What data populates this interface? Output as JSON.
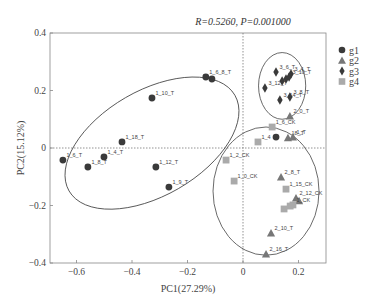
{
  "chart_data": {
    "type": "scatter",
    "title": "R=0.5260, P=0.001000",
    "xlabel": "PC1(27.29%)",
    "ylabel": "PC2(15.12%)",
    "xlim": [
      -0.69,
      0.3
    ],
    "ylim": [
      -0.4,
      0.4
    ],
    "xticks": [
      -0.6,
      -0.4,
      -0.2,
      0,
      0.2
    ],
    "xtick_labels": [
      "-0.6",
      "-0.4",
      "-0.2",
      "0",
      "0.2"
    ],
    "yticks": [
      0.4,
      0.2,
      0,
      -0.2,
      -0.4
    ],
    "ytick_labels": [
      "0.4",
      "0.2",
      "0",
      "-0.2",
      "-0.4"
    ],
    "grid": false,
    "zero_lines": true,
    "legend_position": "right",
    "legend": [
      {
        "name": "g1",
        "marker": "circle",
        "color": "#3a3a3a"
      },
      {
        "name": "g2",
        "marker": "triangle",
        "color": "#777777"
      },
      {
        "name": "g3",
        "marker": "diamond",
        "color": "#3a3a3a"
      },
      {
        "name": "g4",
        "marker": "square",
        "color": "#aaaaaa"
      }
    ],
    "series": [
      {
        "name": "g1",
        "points": [
          {
            "label": "1_6_T",
            "x": -0.649,
            "y": -0.042
          },
          {
            "label": "1_8_T",
            "x": -0.559,
            "y": -0.066
          },
          {
            "label": "1_4_T",
            "x": -0.501,
            "y": -0.031
          },
          {
            "label": "1_18_T",
            "x": -0.436,
            "y": 0.021
          },
          {
            "label": "1_10_T",
            "x": -0.328,
            "y": 0.174
          },
          {
            "label": "1_6_8_T",
            "x": -0.134,
            "y": 0.247
          },
          {
            "label": "",
            "x": -0.112,
            "y": 0.24
          },
          {
            "label": "1_12_T",
            "x": -0.314,
            "y": -0.066
          },
          {
            "label": "1_9_T",
            "x": -0.267,
            "y": -0.136
          },
          {
            "label": "",
            "x": 0.119,
            "y": 0.038
          }
        ]
      },
      {
        "name": "g2",
        "points": [
          {
            "label": "2_0_T",
            "x": 0.169,
            "y": 0.111
          },
          {
            "label": "18_T",
            "x": 0.162,
            "y": 0.035
          },
          {
            "label": "1_T",
            "x": 0.18,
            "y": 0.038
          },
          {
            "label": "2_8_T",
            "x": 0.137,
            "y": -0.101
          },
          {
            "label": "2_12_CK",
            "x": 0.191,
            "y": -0.174
          },
          {
            "label": "",
            "x": 0.202,
            "y": -0.184
          },
          {
            "label": "2_10_T",
            "x": 0.101,
            "y": -0.296
          },
          {
            "label": "2_16_T",
            "x": 0.083,
            "y": -0.369
          }
        ]
      },
      {
        "name": "g3",
        "points": [
          {
            "label": "3_6_T",
            "x": 0.119,
            "y": 0.264
          },
          {
            "label": "3_4_T",
            "x": 0.173,
            "y": 0.257
          },
          {
            "label": "3_12_T",
            "x": 0.079,
            "y": 0.209
          },
          {
            "label": "",
            "x": 0.141,
            "y": 0.233
          },
          {
            "label": "",
            "x": 0.155,
            "y": 0.24
          },
          {
            "label": "3_10_T",
            "x": 0.166,
            "y": 0.247
          },
          {
            "label": "3_14_T",
            "x": 0.133,
            "y": 0.167
          },
          {
            "label": "3_8_T",
            "x": 0.169,
            "y": 0.177
          }
        ]
      },
      {
        "name": "g4",
        "points": [
          {
            "label": "1_6_CK",
            "x": 0.105,
            "y": 0.073
          },
          {
            "label": "1_4",
            "x": 0.054,
            "y": 0.021
          },
          {
            "label": "1_2_CK",
            "x": -0.061,
            "y": -0.042
          },
          {
            "label": "1_0_CK",
            "x": -0.032,
            "y": -0.115
          },
          {
            "label": "1_15_CK",
            "x": 0.155,
            "y": -0.143
          },
          {
            "label": "1_CK",
            "x": 0.18,
            "y": -0.198
          },
          {
            "label": "",
            "x": 0.148,
            "y": -0.212
          },
          {
            "label": "",
            "x": 0.17,
            "y": -0.202
          }
        ]
      }
    ],
    "ellipses": [
      {
        "group": "g1",
        "cx": -0.328,
        "cy": 0.017,
        "rx": 0.345,
        "ry": 0.183,
        "angle_deg": -30
      },
      {
        "group": "g3",
        "cx": 0.141,
        "cy": 0.216,
        "rx": 0.085,
        "ry": 0.116,
        "angle_deg": 0
      },
      {
        "group": "g2_g4",
        "cx": 0.083,
        "cy": -0.15,
        "rx": 0.191,
        "ry": 0.223,
        "angle_deg": 0
      }
    ]
  }
}
